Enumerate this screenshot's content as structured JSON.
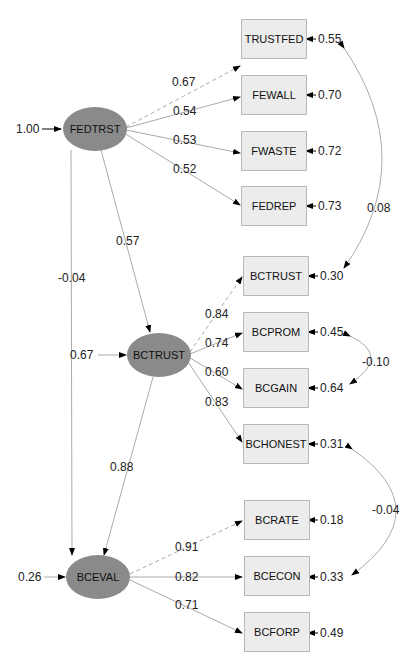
{
  "diagram": {
    "type": "structural-equation-model",
    "latent": [
      {
        "name": "FEDTRST",
        "variance": "1.00"
      },
      {
        "name": "BCTRUST",
        "residual": "0.67"
      },
      {
        "name": "BCEVAL",
        "residual": "0.26"
      }
    ],
    "structural_paths": [
      {
        "from": "FEDTRST",
        "to": "BCTRUST",
        "coef": "0.57"
      },
      {
        "from": "FEDTRST",
        "to": "BCEVAL",
        "coef": "-0.04"
      },
      {
        "from": "BCTRUST",
        "to": "BCEVAL",
        "coef": "0.88"
      }
    ],
    "indicators": [
      {
        "name": "TRUSTFED",
        "latent": "FEDTRST",
        "loading": "0.67",
        "error": "0.55",
        "fixed": true
      },
      {
        "name": "FEWALL",
        "latent": "FEDTRST",
        "loading": "0.54",
        "error": "0.70"
      },
      {
        "name": "FWASTE",
        "latent": "FEDTRST",
        "loading": "0.53",
        "error": "0.72"
      },
      {
        "name": "FEDREP",
        "latent": "FEDTRST",
        "loading": "0.52",
        "error": "0.73"
      },
      {
        "name": "BCTRUST",
        "latent": "BCTRUST",
        "loading": "0.84",
        "error": "0.30",
        "fixed": true
      },
      {
        "name": "BCPROM",
        "latent": "BCTRUST",
        "loading": "0.74",
        "error": "0.45"
      },
      {
        "name": "BCGAIN",
        "latent": "BCTRUST",
        "loading": "0.60",
        "error": "0.64"
      },
      {
        "name": "BCHONEST",
        "latent": "BCTRUST",
        "loading": "0.83",
        "error": "0.31"
      },
      {
        "name": "BCRATE",
        "latent": "BCEVAL",
        "loading": "0.91",
        "error": "0.18",
        "fixed": true
      },
      {
        "name": "BCECON",
        "latent": "BCEVAL",
        "loading": "0.82",
        "error": "0.33"
      },
      {
        "name": "BCFORP",
        "latent": "BCEVAL",
        "loading": "0.71",
        "error": "0.49"
      }
    ],
    "covariances": [
      {
        "between": [
          "TRUSTFED",
          "BCTRUST"
        ],
        "value": "0.08"
      },
      {
        "between": [
          "BCPROM",
          "BCGAIN"
        ],
        "value": "-0.10"
      },
      {
        "between": [
          "BCHONEST",
          "BCECON"
        ],
        "value": "-0.04"
      }
    ]
  }
}
